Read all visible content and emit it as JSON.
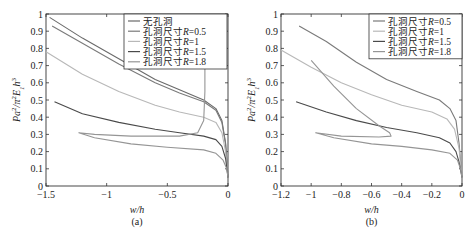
{
  "chart_data": [
    {
      "type": "line",
      "panel": "(a)",
      "xlabel": "w/h",
      "ylabel": "Pa²/π²E₁h³",
      "xlim": [
        -1.5,
        0
      ],
      "ylim": [
        0,
        1
      ],
      "xticks": [
        "-1.5",
        "-1",
        "-0.5",
        "0"
      ],
      "yticks": [
        "0",
        "0.1",
        "0.2",
        "0.3",
        "0.4",
        "0.5",
        "0.6",
        "0.7",
        "0.8",
        "0.9",
        "1"
      ],
      "grid": false,
      "legend_position": "upper right",
      "series": [
        {
          "name": "无孔洞",
          "color": "#6a6a6a",
          "points": [
            [
              -1.47,
              0.98
            ],
            [
              -1.2,
              0.86
            ],
            [
              -0.9,
              0.74
            ],
            [
              -0.6,
              0.62
            ],
            [
              -0.4,
              0.56
            ],
            [
              -0.2,
              0.5
            ],
            [
              -0.1,
              0.45
            ],
            [
              -0.05,
              0.38
            ],
            [
              -0.02,
              0.25
            ],
            [
              0,
              0.05
            ]
          ]
        },
        {
          "name": "孔洞尺寸R=0.5",
          "color": "#7a7a7a",
          "points": [
            [
              -1.45,
              0.93
            ],
            [
              -1.2,
              0.83
            ],
            [
              -0.9,
              0.71
            ],
            [
              -0.6,
              0.6
            ],
            [
              -0.4,
              0.54
            ],
            [
              -0.2,
              0.49
            ],
            [
              -0.1,
              0.44
            ],
            [
              -0.05,
              0.37
            ],
            [
              -0.02,
              0.24
            ],
            [
              0,
              0.05
            ]
          ]
        },
        {
          "name": "孔洞尺寸R=1",
          "color": "#b8b8b8",
          "points": [
            [
              -1.5,
              0.78
            ],
            [
              -1.2,
              0.65
            ],
            [
              -0.9,
              0.55
            ],
            [
              -0.6,
              0.47
            ],
            [
              -0.4,
              0.43
            ],
            [
              -0.2,
              0.4
            ],
            [
              -0.1,
              0.37
            ],
            [
              -0.05,
              0.31
            ],
            [
              -0.02,
              0.2
            ],
            [
              0,
              0.05
            ]
          ]
        },
        {
          "name": "孔洞尺寸R=1.5",
          "color": "#4a4a4a",
          "points": [
            [
              -1.43,
              0.49
            ],
            [
              -1.2,
              0.42
            ],
            [
              -0.9,
              0.37
            ],
            [
              -0.6,
              0.33
            ],
            [
              -0.4,
              0.31
            ],
            [
              -0.2,
              0.29
            ],
            [
              -0.1,
              0.27
            ],
            [
              -0.05,
              0.23
            ],
            [
              -0.02,
              0.16
            ],
            [
              0,
              0.05
            ]
          ]
        },
        {
          "name": "孔洞尺寸R=1.8",
          "color": "#959595",
          "points": [
            [
              -0.19,
              0.72
            ],
            [
              -0.19,
              0.55
            ],
            [
              -0.2,
              0.38
            ],
            [
              -0.25,
              0.31
            ],
            [
              -0.4,
              0.29
            ],
            [
              -0.8,
              0.29
            ],
            [
              -1.1,
              0.3
            ],
            [
              -1.23,
              0.31
            ],
            [
              -1.1,
              0.28
            ],
            [
              -0.8,
              0.245
            ],
            [
              -0.5,
              0.225
            ],
            [
              -0.2,
              0.21
            ],
            [
              -0.1,
              0.19
            ],
            [
              -0.04,
              0.15
            ],
            [
              -0.01,
              0.1
            ],
            [
              0,
              0.05
            ]
          ]
        }
      ]
    },
    {
      "type": "line",
      "panel": "(b)",
      "xlabel": "w/h",
      "ylabel": "Pa²/π²E₁h³",
      "xlim": [
        -1.2,
        0
      ],
      "ylim": [
        0,
        1
      ],
      "xticks": [
        "-1.2",
        "-1",
        "-0.8",
        "-0.6",
        "-0.4",
        "-0.2",
        "0"
      ],
      "yticks": [
        "0",
        "0.1",
        "0.2",
        "0.3",
        "0.4",
        "0.5",
        "0.6",
        "0.7",
        "0.8",
        "0.9",
        "1"
      ],
      "grid": false,
      "legend_position": "upper right",
      "series": [
        {
          "name": "孔洞尺寸R=0.5",
          "color": "#7a7a7a",
          "points": [
            [
              -1.08,
              0.93
            ],
            [
              -0.9,
              0.84
            ],
            [
              -0.7,
              0.72
            ],
            [
              -0.5,
              0.62
            ],
            [
              -0.3,
              0.55
            ],
            [
              -0.15,
              0.5
            ],
            [
              -0.08,
              0.45
            ],
            [
              -0.04,
              0.38
            ],
            [
              -0.02,
              0.25
            ],
            [
              0,
              0.05
            ]
          ]
        },
        {
          "name": "孔洞尺寸R=1",
          "color": "#b8b8b8",
          "points": [
            [
              -1.2,
              0.79
            ],
            [
              -1.0,
              0.69
            ],
            [
              -0.8,
              0.6
            ],
            [
              -0.6,
              0.53
            ],
            [
              -0.4,
              0.47
            ],
            [
              -0.2,
              0.43
            ],
            [
              -0.1,
              0.39
            ],
            [
              -0.05,
              0.33
            ],
            [
              -0.02,
              0.22
            ],
            [
              0,
              0.05
            ]
          ]
        },
        {
          "name": "孔洞尺寸R=1.5",
          "color": "#4a4a4a",
          "points": [
            [
              -1.1,
              0.49
            ],
            [
              -0.9,
              0.43
            ],
            [
              -0.7,
              0.38
            ],
            [
              -0.5,
              0.34
            ],
            [
              -0.3,
              0.31
            ],
            [
              -0.15,
              0.28
            ],
            [
              -0.08,
              0.25
            ],
            [
              -0.04,
              0.2
            ],
            [
              -0.02,
              0.14
            ],
            [
              0,
              0.05
            ]
          ]
        },
        {
          "name": "孔洞尺寸R=1.8",
          "color": "#959595",
          "points": [
            [
              -1.0,
              0.73
            ],
            [
              -0.85,
              0.58
            ],
            [
              -0.7,
              0.45
            ],
            [
              -0.55,
              0.35
            ],
            [
              -0.48,
              0.31
            ],
            [
              -0.47,
              0.29
            ],
            [
              -0.55,
              0.285
            ],
            [
              -0.8,
              0.29
            ],
            [
              -0.97,
              0.31
            ],
            [
              -0.85,
              0.28
            ],
            [
              -0.6,
              0.245
            ],
            [
              -0.4,
              0.23
            ],
            [
              -0.2,
              0.21
            ],
            [
              -0.08,
              0.19
            ],
            [
              -0.03,
              0.15
            ],
            [
              -0.01,
              0.1
            ],
            [
              0,
              0.05
            ]
          ]
        }
      ]
    }
  ],
  "panels": {
    "a": {
      "caption": "(a)",
      "xlabel": "w/h",
      "legend": [
        "无孔洞",
        "孔洞尺寸R=0.5",
        "孔洞尺寸R=1",
        "孔洞尺寸R=1.5",
        "孔洞尺寸R=1.8"
      ]
    },
    "b": {
      "caption": "(b)",
      "xlabel": "w/h",
      "legend": [
        "孔洞尺寸R=0.5",
        "孔洞尺寸R=1",
        "孔洞尺寸R=1.5",
        "孔洞尺寸R=1.8"
      ]
    }
  }
}
